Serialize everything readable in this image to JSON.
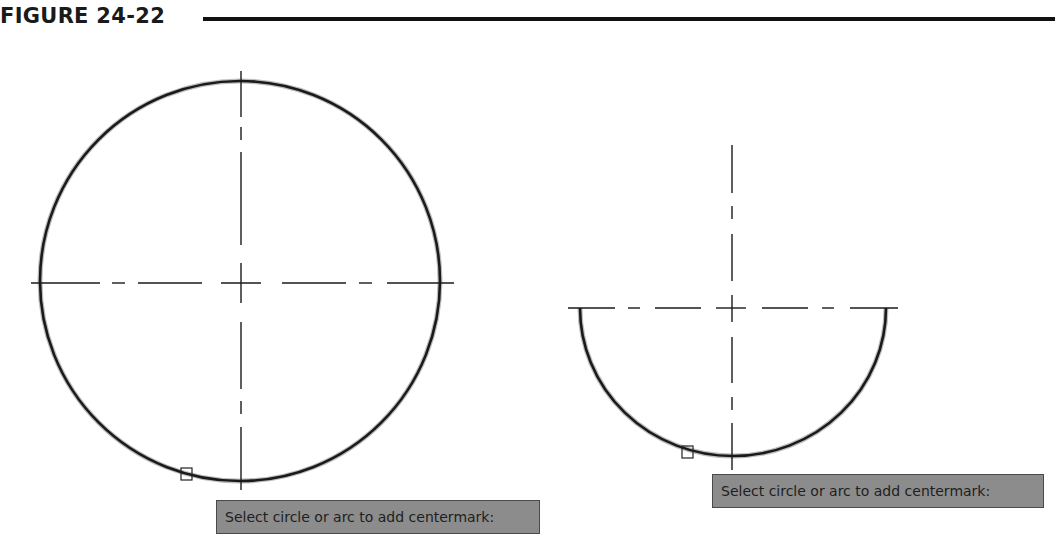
{
  "figure": {
    "title": "FIGURE 24-22"
  },
  "drawing": {
    "shapes": [
      {
        "type": "circle",
        "label": "full-circle",
        "center_x": 240,
        "center_y": 283,
        "radius": 200
      },
      {
        "type": "arc",
        "label": "semicircle-arc",
        "center_x": 733,
        "center_y": 308,
        "radius": 152
      }
    ],
    "pickbox_count": 2
  },
  "tooltips": {
    "left": "Select circle or arc to add centermark:",
    "right": "Select circle or arc to add centermark:"
  },
  "colors": {
    "tooltip_bg": "#8c8c8c",
    "stroke": "#1a1a1a"
  }
}
